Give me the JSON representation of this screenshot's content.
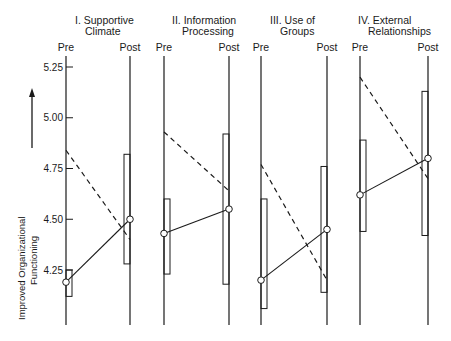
{
  "chart_data": {
    "type": "line",
    "title": "",
    "ylabel": "Improved Organizational Functioning",
    "ylabel_line1": "Improved Organizational",
    "ylabel_line2": "Functioning",
    "yticks": [
      "5.25",
      "5.00",
      "4.75",
      "4.50",
      "4.25"
    ],
    "ytick_values": [
      5.25,
      5.0,
      4.75,
      4.5,
      4.25
    ],
    "ylim": [
      4.05,
      5.35
    ],
    "x_labels": [
      "Pre",
      "Post"
    ],
    "legend": {
      "solid_line_with_circles": "Group mean (Pre to Post)",
      "dashed_line": "Comparison trend",
      "rectangles": "Range / spread"
    },
    "panels": [
      {
        "title_line1": "I. Supportive",
        "title_line2": "Climate",
        "solid": {
          "pre": 4.19,
          "post": 4.5
        },
        "dashed": {
          "pre": 4.84,
          "post": 4.4
        },
        "range_pre": [
          4.12,
          4.25
        ],
        "range_post": [
          4.28,
          4.82
        ]
      },
      {
        "title_line1": "II. Information",
        "title_line2": "Processing",
        "solid": {
          "pre": 4.43,
          "post": 4.55
        },
        "dashed": {
          "pre": 4.93,
          "post": 4.64
        },
        "range_pre": [
          4.23,
          4.6
        ],
        "range_post": [
          4.18,
          4.92
        ]
      },
      {
        "title_line1": "III. Use of",
        "title_line2": "Groups",
        "solid": {
          "pre": 4.2,
          "post": 4.45
        },
        "dashed": {
          "pre": 4.77,
          "post": 4.2
        },
        "range_pre": [
          4.06,
          4.6
        ],
        "range_post": [
          4.14,
          4.76
        ]
      },
      {
        "title_line1": "IV. External",
        "title_line2": "Relationships",
        "solid": {
          "pre": 4.62,
          "post": 4.8
        },
        "dashed": {
          "pre": 5.2,
          "post": 4.7
        },
        "range_pre": [
          4.44,
          4.89
        ],
        "range_post": [
          4.42,
          5.13
        ]
      }
    ]
  }
}
